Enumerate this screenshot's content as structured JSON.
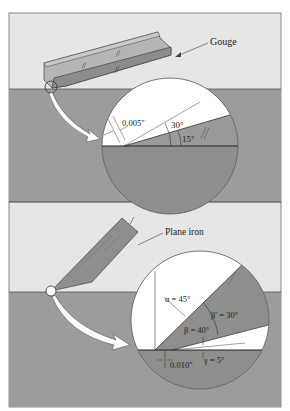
{
  "figure": {
    "top_panel": {
      "tool_label": "Gouge",
      "thickness_label": "0.005″",
      "angle_outer_label": "30°",
      "angle_inner_label": "15°"
    },
    "bottom_panel": {
      "tool_label": "Plane iron",
      "alpha_label": "α = 45°",
      "beta_prime_label": "β′ = 30°",
      "beta_label": "β = 40°",
      "gamma_label": "γ = 5°",
      "thickness_label": "0.010″"
    },
    "colors": {
      "sky": "#e6e6e4",
      "wood": "#9a9a98",
      "wood_dark": "#8a8a88",
      "tool": "#8e8e8c",
      "tool_light": "#b8b8b6",
      "magnifier": "#ffffff",
      "line": "#333333"
    }
  }
}
